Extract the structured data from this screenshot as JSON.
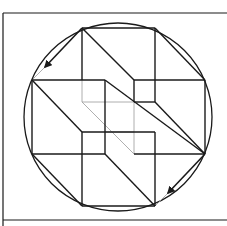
{
  "diagram": {
    "title": "",
    "stroke_color": "#1a1a1a",
    "hidden_line_color": "#9a9a9a",
    "background": "#ffffff",
    "frame": {
      "left": 3,
      "top": 13,
      "bottom": 220,
      "right": 227
    },
    "circle": {
      "cx": 118,
      "cy": 117,
      "r": 94
    },
    "octagon_points": [
      [
        82,
        28
      ],
      [
        155,
        28
      ],
      [
        205,
        80
      ],
      [
        205,
        154
      ],
      [
        155,
        206
      ],
      [
        82,
        206
      ],
      [
        32,
        154
      ],
      [
        32,
        80
      ]
    ],
    "arrows": [
      {
        "from": [
          82,
          28
        ],
        "to": [
          45,
          67
        ],
        "ghost_to": [
          32,
          80
        ]
      },
      {
        "from": [
          205,
          154
        ],
        "to": [
          168,
          193
        ],
        "ghost_to": [
          155,
          206
        ]
      }
    ]
  }
}
